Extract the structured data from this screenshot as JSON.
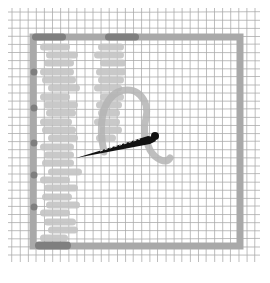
{
  "illustration": {
    "subject": "needlework-canvas",
    "colors": {
      "background": "#ffffff",
      "grid": "#a8a8a8",
      "frame": "#a9a9a9",
      "frame_dark": "#7f7f7f",
      "stitch": "#c4c4c4",
      "thread": "#b4b4b4",
      "needle": "#111111"
    },
    "grid": {
      "x0": 12,
      "y0": 12,
      "x1": 256,
      "y1": 258,
      "step": 8.1
    },
    "frame": {
      "x": 33,
      "y": 37,
      "w": 207,
      "h": 209,
      "stroke": 7
    },
    "stitch_rows_left": [
      {
        "y": 47,
        "x": 40,
        "w": 30
      },
      {
        "y": 55,
        "x": 46,
        "w": 32
      },
      {
        "y": 63,
        "x": 44,
        "w": 30
      },
      {
        "y": 72,
        "x": 40,
        "w": 34
      },
      {
        "y": 80,
        "x": 42,
        "w": 34
      },
      {
        "y": 88,
        "x": 48,
        "w": 32
      },
      {
        "y": 97,
        "x": 40,
        "w": 30
      },
      {
        "y": 105,
        "x": 44,
        "w": 34
      },
      {
        "y": 113,
        "x": 46,
        "w": 30
      },
      {
        "y": 122,
        "x": 40,
        "w": 32
      },
      {
        "y": 130,
        "x": 42,
        "w": 34
      },
      {
        "y": 138,
        "x": 48,
        "w": 30
      },
      {
        "y": 147,
        "x": 40,
        "w": 34
      },
      {
        "y": 155,
        "x": 44,
        "w": 30
      },
      {
        "y": 163,
        "x": 42,
        "w": 32
      },
      {
        "y": 172,
        "x": 48,
        "w": 34
      },
      {
        "y": 180,
        "x": 40,
        "w": 30
      },
      {
        "y": 188,
        "x": 44,
        "w": 34
      },
      {
        "y": 197,
        "x": 42,
        "w": 30
      },
      {
        "y": 205,
        "x": 46,
        "w": 34
      },
      {
        "y": 213,
        "x": 40,
        "w": 30
      },
      {
        "y": 222,
        "x": 44,
        "w": 32
      },
      {
        "y": 230,
        "x": 48,
        "w": 30
      },
      {
        "y": 238,
        "x": 40,
        "w": 28
      }
    ],
    "stitch_rows_right": [
      {
        "y": 47,
        "x": 98,
        "w": 26
      },
      {
        "y": 55,
        "x": 94,
        "w": 30
      },
      {
        "y": 63,
        "x": 100,
        "w": 26
      },
      {
        "y": 72,
        "x": 96,
        "w": 30
      },
      {
        "y": 80,
        "x": 98,
        "w": 26
      },
      {
        "y": 88,
        "x": 94,
        "w": 28
      },
      {
        "y": 97,
        "x": 100,
        "w": 24
      },
      {
        "y": 105,
        "x": 96,
        "w": 26
      },
      {
        "y": 113,
        "x": 98,
        "w": 22
      },
      {
        "y": 122,
        "x": 94,
        "w": 26
      },
      {
        "y": 130,
        "x": 100,
        "w": 22
      },
      {
        "y": 138,
        "x": 96,
        "w": 20
      }
    ],
    "left_nubs_y": [
      72,
      108,
      143,
      175,
      207
    ]
  }
}
